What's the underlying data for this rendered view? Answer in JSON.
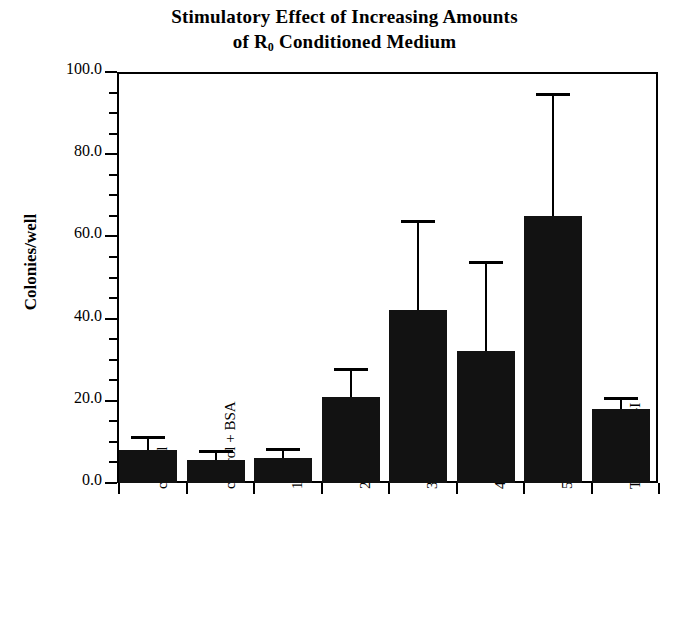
{
  "chart": {
    "title_line1": "Stimulatory Effect of Increasing Amounts",
    "title_line2_pre": "of R",
    "title_line2_sub": "0",
    "title_line2_post": " Conditioned Medium",
    "ylabel": "Colonies/well",
    "bar_color": "#121212"
  },
  "chart_data": {
    "type": "bar",
    "title": "Stimulatory Effect of Increasing Amounts of R0 Conditioned Medium",
    "xlabel": "",
    "ylabel": "Colonies/well",
    "ylim": [
      0.0,
      100.0
    ],
    "ytick_labels": [
      "0.0",
      "20.0",
      "40.0",
      "60.0",
      "80.0",
      "100.0"
    ],
    "ytick_values": [
      0,
      20,
      40,
      60,
      80,
      100
    ],
    "yminor_step": 5,
    "grid": false,
    "legend": null,
    "categories": [
      "control",
      "control + BSA",
      "10%",
      "20%",
      "30%",
      "40%",
      "50%",
      "TGFα + IGF-I"
    ],
    "values": [
      8,
      5.5,
      6,
      21,
      42,
      32,
      65,
      18
    ],
    "errors_upper": [
      11.5,
      8,
      8.5,
      28,
      64,
      54,
      95,
      21
    ],
    "error_bars": "upper-only"
  }
}
